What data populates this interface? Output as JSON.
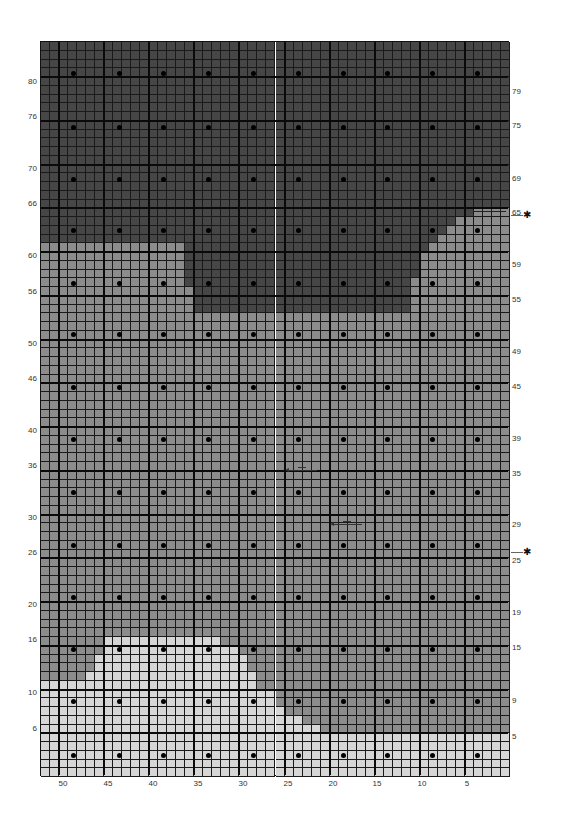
{
  "chart_data": {
    "type": "knitting-chart",
    "title": "",
    "columns": 52,
    "rows": 84,
    "bold_every_cols": 5,
    "bold_every_rows": 5,
    "colors": {
      "dark": "#464646",
      "medium": "#8c8c8c",
      "light": "#d6d6d6",
      "grid": "#1a1a1a"
    },
    "left_row_labels": [
      "80",
      "76",
      "70",
      "66",
      "60",
      "56",
      "50",
      "46",
      "40",
      "36",
      "30",
      "26",
      "20",
      "16",
      "10",
      "6"
    ],
    "right_row_labels": [
      "79",
      "75",
      "69",
      "65",
      "59",
      "55",
      "49",
      "45",
      "39",
      "35",
      "29",
      "25",
      "19",
      "15",
      "9",
      "5"
    ],
    "stitch_labels": [
      "50",
      "45",
      "40",
      "35",
      "30",
      "25",
      "20",
      "15",
      "10",
      "5"
    ],
    "markers": [
      {
        "row": "65",
        "symbol": "✱",
        "note": "start marker, arrow on right"
      },
      {
        "row": "23",
        "symbol": "✱",
        "note": "marker"
      }
    ],
    "arrows": [
      {
        "row": "35",
        "direction": "left",
        "from_stitch": 21,
        "to_stitch": 25
      },
      {
        "row": "29",
        "direction": "left",
        "from_stitch": 16,
        "to_stitch": 20
      }
    ],
    "regions": {
      "dark": "top rows 80 down to ~61 full width; center block rows ~60–54 between stitches ~37 and ~11",
      "medium": "rows ~64–12 bulk of chart; right edge staircase from row 64",
      "light": "bottom rows 1–6 full width; lower-left mound rows ~7–16 stitches ~50–31"
    }
  }
}
